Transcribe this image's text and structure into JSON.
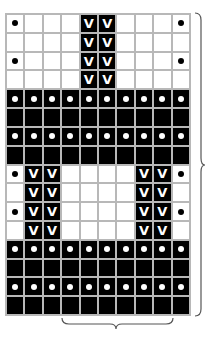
{
  "chart_title": "",
  "grid": {
    "columns": 10,
    "rows": 16,
    "legend": {
      "W": "white empty",
      "D": "white with black dot",
      "V": "black with V",
      "B": "black empty",
      "O": "black with white dot"
    },
    "pattern": [
      "DWWWVVWWWD",
      "WWWWVVWWWW",
      "DWWWVVWWWD",
      "WWWWVVWWWW",
      "OOOOOOOOOO",
      "BBBBBBBBBB",
      "OOOOOOOOOO",
      "BBBBBBBBBB",
      "DVVWWWWVVD",
      "WVVWWWWVVW",
      "DVVWWWWVVD",
      "WVVWWWWVVW",
      "OOOOOOOOOO",
      "BBBBBBBBBB",
      "OOOOOOOOOO",
      "BBBBBBBBBB"
    ]
  },
  "symbols": {
    "v_glyph": "V"
  },
  "colors": {
    "grid_line": "#b8b8b8",
    "dark": "#000000",
    "light": "#ffffff"
  },
  "braces": {
    "right": "row repeat",
    "bottom": "stitch repeat"
  }
}
